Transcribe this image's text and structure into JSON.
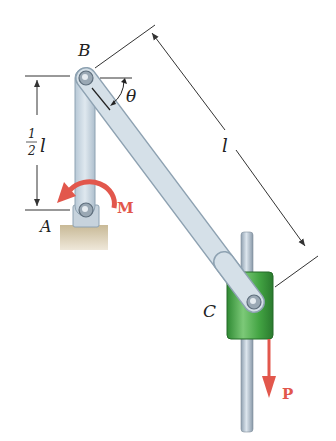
{
  "diagram": {
    "type": "mechanism",
    "labels": {
      "point_b": "B",
      "point_a": "A",
      "point_c": "C",
      "angle": "θ",
      "length": "l",
      "half_length_num": "1",
      "half_length_den": "2",
      "half_length_var": "l",
      "moment": "M",
      "force": "P"
    },
    "colors": {
      "link": "#c9d6e0",
      "link_edge": "#8ea2b2",
      "collar": "#4aa84a",
      "collar_dark": "#2e7d32",
      "rod": "#a9b8c6",
      "load_arrow": "#e2574c",
      "ground": "#d9cdb4",
      "dimension": "#333333"
    },
    "components": [
      {
        "id": "AB",
        "desc": "vertical link from pin A to pin B"
      },
      {
        "id": "BC",
        "desc": "inclined link of length l from B to collar C at angle theta"
      },
      {
        "id": "C",
        "desc": "green collar sliding on vertical rod"
      },
      {
        "id": "A",
        "desc": "pin support on ground"
      }
    ]
  }
}
